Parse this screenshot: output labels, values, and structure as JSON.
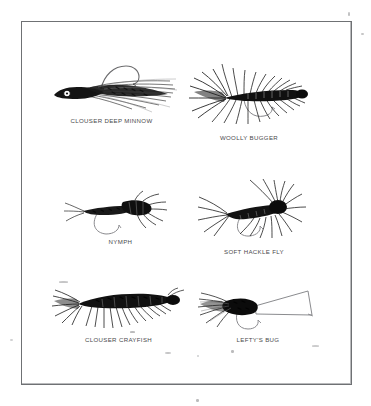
{
  "plate": {
    "background_color": "#ffffff",
    "border_color": "#6f7174",
    "ink_color": "#111111",
    "label_color": "#4a4a4c"
  },
  "flies": [
    {
      "id": "clouser-deep-minnow",
      "label": "CLOUSER DEEP MINNOW",
      "icon": "streamer-fly-icon",
      "row": 1,
      "column": 1
    },
    {
      "id": "woolly-bugger",
      "label": "WOOLLY BUGGER",
      "icon": "hackled-streamer-fly-icon",
      "row": 1,
      "column": 2
    },
    {
      "id": "nymph",
      "label": "NYMPH",
      "icon": "nymph-fly-icon",
      "row": 2,
      "column": 1
    },
    {
      "id": "soft-hackle-fly",
      "label": "SOFT HACKLE FLY",
      "icon": "soft-hackle-fly-icon",
      "row": 2,
      "column": 2
    },
    {
      "id": "clouser-crayfish",
      "label": "CLOUSER CRAYFISH",
      "icon": "crayfish-fly-icon",
      "row": 3,
      "column": 1
    },
    {
      "id": "leftys-bug",
      "label": "LEFTY'S BUG",
      "icon": "popper-bug-fly-icon",
      "row": 3,
      "column": 2
    }
  ]
}
